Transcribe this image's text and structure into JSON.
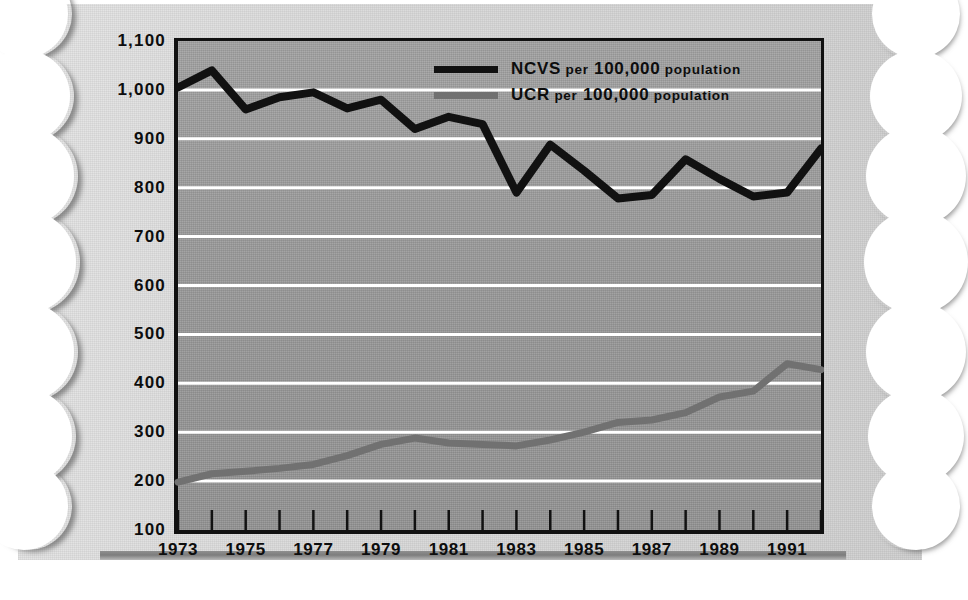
{
  "chart_data": {
    "type": "line",
    "title": "",
    "xlabel": "",
    "ylabel": "",
    "xlim": [
      1973,
      1992
    ],
    "ylim": [
      100,
      1100
    ],
    "grid": true,
    "legend_position": "top-right",
    "x": [
      1973,
      1974,
      1975,
      1976,
      1977,
      1978,
      1979,
      1980,
      1981,
      1982,
      1983,
      1984,
      1985,
      1986,
      1987,
      1988,
      1989,
      1990,
      1991,
      1992
    ],
    "xtick_labels": [
      "1973",
      "1975",
      "1977",
      "1979",
      "1981",
      "1983",
      "1985",
      "1987",
      "1989",
      "1991"
    ],
    "xtick_values": [
      1973,
      1975,
      1977,
      1979,
      1981,
      1983,
      1985,
      1987,
      1989,
      1991
    ],
    "ytick_labels": [
      "1,100",
      "1,000",
      "900",
      "800",
      "700",
      "600",
      "500",
      "400",
      "300",
      "200",
      "100"
    ],
    "ytick_values": [
      1100,
      1000,
      900,
      800,
      700,
      600,
      500,
      400,
      300,
      200,
      100
    ],
    "series": [
      {
        "name": "NCVS per 100,000 population",
        "color": "#111111",
        "values": [
          1005,
          1040,
          960,
          985,
          995,
          962,
          980,
          920,
          945,
          930,
          790,
          888,
          835,
          778,
          785,
          858,
          818,
          782,
          790,
          880
        ]
      },
      {
        "name": "UCR per 100,000 population",
        "color": "#717171",
        "values": [
          198,
          215,
          220,
          226,
          234,
          252,
          275,
          288,
          278,
          275,
          272,
          284,
          300,
          320,
          325,
          340,
          372,
          384,
          440,
          428
        ]
      }
    ]
  },
  "legend": {
    "items": [
      {
        "label_main": "NCVS",
        "label_rest_a": "per",
        "label_rest_b": "100,000",
        "label_rest_c": "population",
        "series": "NCVS"
      },
      {
        "label_main": "UCR",
        "label_rest_a": "per",
        "label_rest_b": "100,000",
        "label_rest_c": "population",
        "series": "UCR"
      }
    ]
  }
}
